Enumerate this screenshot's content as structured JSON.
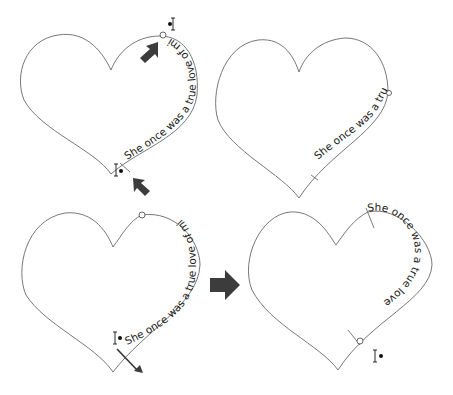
{
  "figure": {
    "path_text": "She once was a true love of mine",
    "panels": [
      {
        "id": "top-left",
        "text": "She once was a true love of mine",
        "note": "start and end handles highlighted by arrows"
      },
      {
        "id": "top-right",
        "text": "She once was a true",
        "note": "end handle moved; text truncated"
      },
      {
        "id": "bottom-left",
        "text": "She once was a true love of mine",
        "note": "dragging start handle along path"
      },
      {
        "id": "bottom-right",
        "text": "She once was a true love of mine",
        "note": "result: text starts at upper right lobe"
      }
    ],
    "colors": {
      "arrow": "#3c3c3c",
      "path": "#555555",
      "text": "#1a1a1a"
    }
  }
}
